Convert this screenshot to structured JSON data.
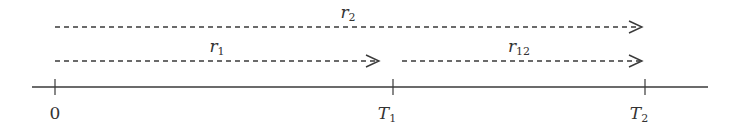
{
  "diagram": {
    "type": "timeline",
    "axis": {
      "color": "#3a3a3a",
      "ticks": [
        {
          "label": "0",
          "main": "0",
          "sub": ""
        },
        {
          "label": "T1",
          "main": "T",
          "sub": "1"
        },
        {
          "label": "T2",
          "main": "T",
          "sub": "2"
        }
      ]
    },
    "arrows": [
      {
        "id": "r2",
        "main": "r",
        "sub": "2",
        "from": "0",
        "to": "T2",
        "style": "dashed"
      },
      {
        "id": "r1",
        "main": "r",
        "sub": "1",
        "from": "0",
        "to": "T1",
        "style": "dashed"
      },
      {
        "id": "r12",
        "main": "r",
        "sub": "12",
        "from": "T1",
        "to": "T2",
        "style": "dashed"
      }
    ]
  }
}
